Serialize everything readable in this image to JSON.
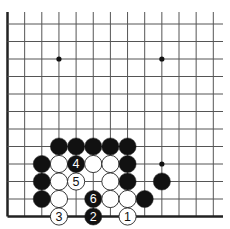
{
  "diagram": {
    "type": "go-board",
    "title": "",
    "grid": {
      "cols": 13,
      "rows": 12,
      "x0": 7.5,
      "dx": 17.15,
      "y0": 24,
      "dy": 17.5,
      "top_extend": 12,
      "right_extend": 223,
      "left_edge_thick": true,
      "bottom_edge_thick": true
    },
    "colors": {
      "line": "#555555",
      "edge": "#222222",
      "black_stone": "#111111",
      "white_stone": "#ffffff",
      "stone_outline": "#222222"
    },
    "star_points": [
      {
        "col": 3,
        "row": 2
      },
      {
        "col": 9,
        "row": 2
      },
      {
        "col": 9,
        "row": 8
      }
    ],
    "stones": [
      {
        "color": "black",
        "col": 3,
        "row": 7,
        "label": ""
      },
      {
        "color": "black",
        "col": 4,
        "row": 7,
        "label": ""
      },
      {
        "color": "black",
        "col": 5,
        "row": 7,
        "label": ""
      },
      {
        "color": "black",
        "col": 6,
        "row": 7,
        "label": ""
      },
      {
        "color": "black",
        "col": 7,
        "row": 7,
        "label": ""
      },
      {
        "color": "black",
        "col": 2,
        "row": 8,
        "label": ""
      },
      {
        "color": "white",
        "col": 3,
        "row": 8,
        "label": ""
      },
      {
        "color": "black",
        "col": 4,
        "row": 8,
        "label": "4"
      },
      {
        "color": "white",
        "col": 5,
        "row": 8,
        "label": ""
      },
      {
        "color": "white",
        "col": 6,
        "row": 8,
        "label": ""
      },
      {
        "color": "black",
        "col": 7,
        "row": 8,
        "label": ""
      },
      {
        "color": "black",
        "col": 2,
        "row": 9,
        "label": ""
      },
      {
        "color": "white",
        "col": 3,
        "row": 9,
        "label": ""
      },
      {
        "color": "white",
        "col": 4,
        "row": 9,
        "label": "5"
      },
      {
        "color": "white",
        "col": 6,
        "row": 9,
        "label": ""
      },
      {
        "color": "black",
        "col": 7,
        "row": 9,
        "label": ""
      },
      {
        "color": "black",
        "col": 9,
        "row": 9,
        "label": ""
      },
      {
        "color": "black",
        "col": 2,
        "row": 10,
        "label": ""
      },
      {
        "color": "white",
        "col": 3,
        "row": 10,
        "label": ""
      },
      {
        "color": "black",
        "col": 5,
        "row": 10,
        "label": "6"
      },
      {
        "color": "white",
        "col": 6,
        "row": 10,
        "label": ""
      },
      {
        "color": "white",
        "col": 7,
        "row": 10,
        "label": ""
      },
      {
        "color": "black",
        "col": 8,
        "row": 10,
        "label": ""
      },
      {
        "color": "white",
        "col": 3,
        "row": 11,
        "label": "3"
      },
      {
        "color": "black",
        "col": 5,
        "row": 11,
        "label": "2"
      },
      {
        "color": "white",
        "col": 7,
        "row": 11,
        "label": "1"
      }
    ]
  }
}
